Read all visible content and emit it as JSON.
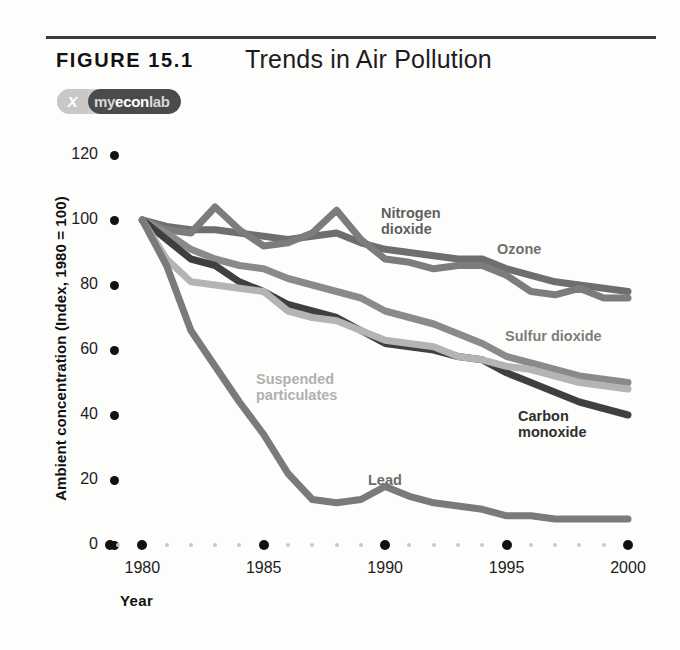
{
  "figure": {
    "label": "FIGURE  15.1",
    "title": "Trends in Air Pollution",
    "badge_glyph": "X",
    "badge_my": "my",
    "badge_econ": "econ",
    "badge_lab": "lab"
  },
  "axes": {
    "ylabel": "Ambient concentration (Index, 1980 = 100)",
    "xlabel": "Year",
    "yticks": [
      0,
      20,
      40,
      60,
      80,
      100,
      120
    ],
    "xticks": [
      1980,
      1985,
      1990,
      1995,
      2000
    ]
  },
  "colors": {
    "nitrogen_dioxide": "#6e6e6e",
    "ozone": "#7c7c7c",
    "sulfur_dioxide": "#8a8a8a",
    "carbon_monoxide": "#3f3f3f",
    "suspended_particulates": "#b4b4b4",
    "lead": "#7a7a7a",
    "axis": "#111111",
    "rule": "#3a3a3a"
  },
  "chart_data": {
    "type": "line",
    "title": "Trends in Air Pollution",
    "xlabel": "Year",
    "ylabel": "Ambient concentration (Index, 1980 = 100)",
    "xlim": [
      1979,
      2000
    ],
    "ylim": [
      0,
      125
    ],
    "grid": false,
    "legend": "inline-labels",
    "x": [
      1980,
      1981,
      1982,
      1983,
      1984,
      1985,
      1986,
      1987,
      1988,
      1989,
      1990,
      1991,
      1992,
      1993,
      1994,
      1995,
      1996,
      1997,
      1998,
      1999,
      2000
    ],
    "series": [
      {
        "name": "Nitrogen dioxide",
        "color": "#6e6e6e",
        "label_text": "Nitrogen\ndioxide",
        "values": [
          100,
          98,
          97,
          97,
          96,
          95,
          94,
          95,
          96,
          93,
          91,
          90,
          89,
          88,
          88,
          85,
          83,
          81,
          80,
          79,
          78
        ]
      },
      {
        "name": "Ozone",
        "color": "#7c7c7c",
        "label_text": "Ozone",
        "values": [
          100,
          97,
          96,
          104,
          97,
          92,
          93,
          96,
          103,
          94,
          88,
          87,
          85,
          86,
          86,
          83,
          78,
          77,
          79,
          76,
          76
        ]
      },
      {
        "name": "Sulfur dioxide",
        "color": "#8a8a8a",
        "label_text": "Sulfur dioxide",
        "values": [
          100,
          96,
          91,
          88,
          86,
          85,
          82,
          80,
          78,
          76,
          72,
          70,
          68,
          65,
          62,
          58,
          56,
          54,
          52,
          51,
          50
        ]
      },
      {
        "name": "Carbon monoxide",
        "color": "#3f3f3f",
        "label_text": "Carbon\nmonoxide",
        "values": [
          100,
          94,
          88,
          86,
          81,
          78,
          74,
          72,
          70,
          66,
          62,
          61,
          60,
          58,
          57,
          53,
          50,
          47,
          44,
          42,
          40
        ]
      },
      {
        "name": "Suspended particulates",
        "color": "#b4b4b4",
        "label_text": "Suspended\nparticulates",
        "values": [
          100,
          88,
          81,
          80,
          79,
          78,
          72,
          70,
          69,
          66,
          63,
          62,
          61,
          58,
          57,
          55,
          54,
          52,
          50,
          49,
          48
        ]
      },
      {
        "name": "Lead",
        "color": "#7a7a7a",
        "label_text": "Lead",
        "values": [
          100,
          86,
          66,
          55,
          44,
          34,
          22,
          14,
          13,
          14,
          18,
          15,
          13,
          12,
          11,
          9,
          9,
          8,
          8,
          8,
          8
        ]
      }
    ]
  }
}
